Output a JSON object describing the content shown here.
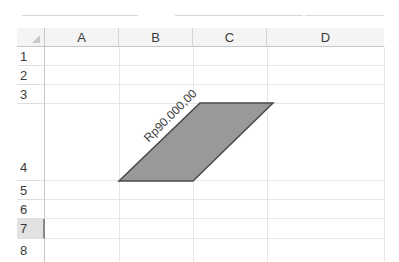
{
  "ribbon": {
    "segments": 3
  },
  "sheet": {
    "columns": [
      {
        "label": "A"
      },
      {
        "label": "B"
      },
      {
        "label": "C"
      },
      {
        "label": "D"
      }
    ],
    "rows": [
      {
        "label": "1"
      },
      {
        "label": "2"
      },
      {
        "label": "3"
      },
      {
        "label": "4"
      },
      {
        "label": "5"
      },
      {
        "label": "6"
      },
      {
        "label": "7",
        "selected": true
      },
      {
        "label": "8"
      }
    ],
    "selected_row": "7"
  },
  "shape": {
    "type": "parallelogram",
    "text": "Rp90.000,00",
    "fill_color": "#999999",
    "border_color": "#4a4a4a"
  },
  "colors": {
    "header_bg": "#f4f4f4",
    "gridline": "#e6e6e6",
    "selected_row_bg": "#e2e2e2"
  }
}
